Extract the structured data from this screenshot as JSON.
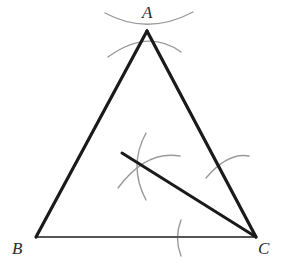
{
  "figure": {
    "background_color": "#ffffff",
    "stroke_dark": "#1a1a1a",
    "stroke_base": "#555555",
    "stroke_arc": "#9a9a9a",
    "labels": [
      {
        "id": "A",
        "text": "A",
        "x": 142,
        "y": 4
      },
      {
        "id": "B",
        "text": "B",
        "x": 12,
        "y": 240
      },
      {
        "id": "C",
        "text": "C",
        "x": 258,
        "y": 240
      }
    ],
    "vertices": {
      "A": {
        "x": 147,
        "y": 31
      },
      "B": {
        "x": 36,
        "y": 237
      },
      "C": {
        "x": 256,
        "y": 237
      }
    },
    "segments": [
      {
        "name": "side-AB",
        "from": "A",
        "to": "B",
        "x1": 147,
        "y1": 31,
        "x2": 36,
        "y2": 237,
        "width": 3.2,
        "color": "#1a1a1a"
      },
      {
        "name": "side-AC",
        "from": "A",
        "to": "C",
        "x1": 147,
        "y1": 31,
        "x2": 256,
        "y2": 237,
        "width": 3.2,
        "color": "#1a1a1a"
      },
      {
        "name": "side-BC",
        "from": "B",
        "to": "C",
        "x1": 36,
        "y1": 237,
        "x2": 256,
        "y2": 237,
        "width": 2.0,
        "color": "#555555"
      },
      {
        "name": "cevian-to-C",
        "from": "point-on-AB",
        "to": "C",
        "x1": 122,
        "y1": 153,
        "x2": 256,
        "y2": 237,
        "width": 3.0,
        "color": "#1a1a1a"
      }
    ],
    "arcs": [
      {
        "name": "apex-arc-left-to-right",
        "path": "M 105,13 Q 148,36 193,12",
        "color": "#9a9a9a",
        "width": 1.4
      },
      {
        "name": "apex-arc-right-to-left",
        "path": "M 108,57 Q 148,28 181,52",
        "color": "#9a9a9a",
        "width": 1.4
      },
      {
        "name": "interior-arc-vertical",
        "path": "M 146,133 Q 128,166 146,200",
        "color": "#9a9a9a",
        "width": 1.4
      },
      {
        "name": "interior-arc-horizontal",
        "path": "M 118,188 Q 146,150 180,156",
        "color": "#9a9a9a",
        "width": 1.4
      },
      {
        "name": "side-ac-tick-arc",
        "path": "M 206,178 Q 228,152 249,156",
        "color": "#9a9a9a",
        "width": 1.4
      },
      {
        "name": "base-bc-tick-arc",
        "path": "M 181,220 Q 174,238 181,256",
        "color": "#9a9a9a",
        "width": 1.4
      }
    ]
  }
}
